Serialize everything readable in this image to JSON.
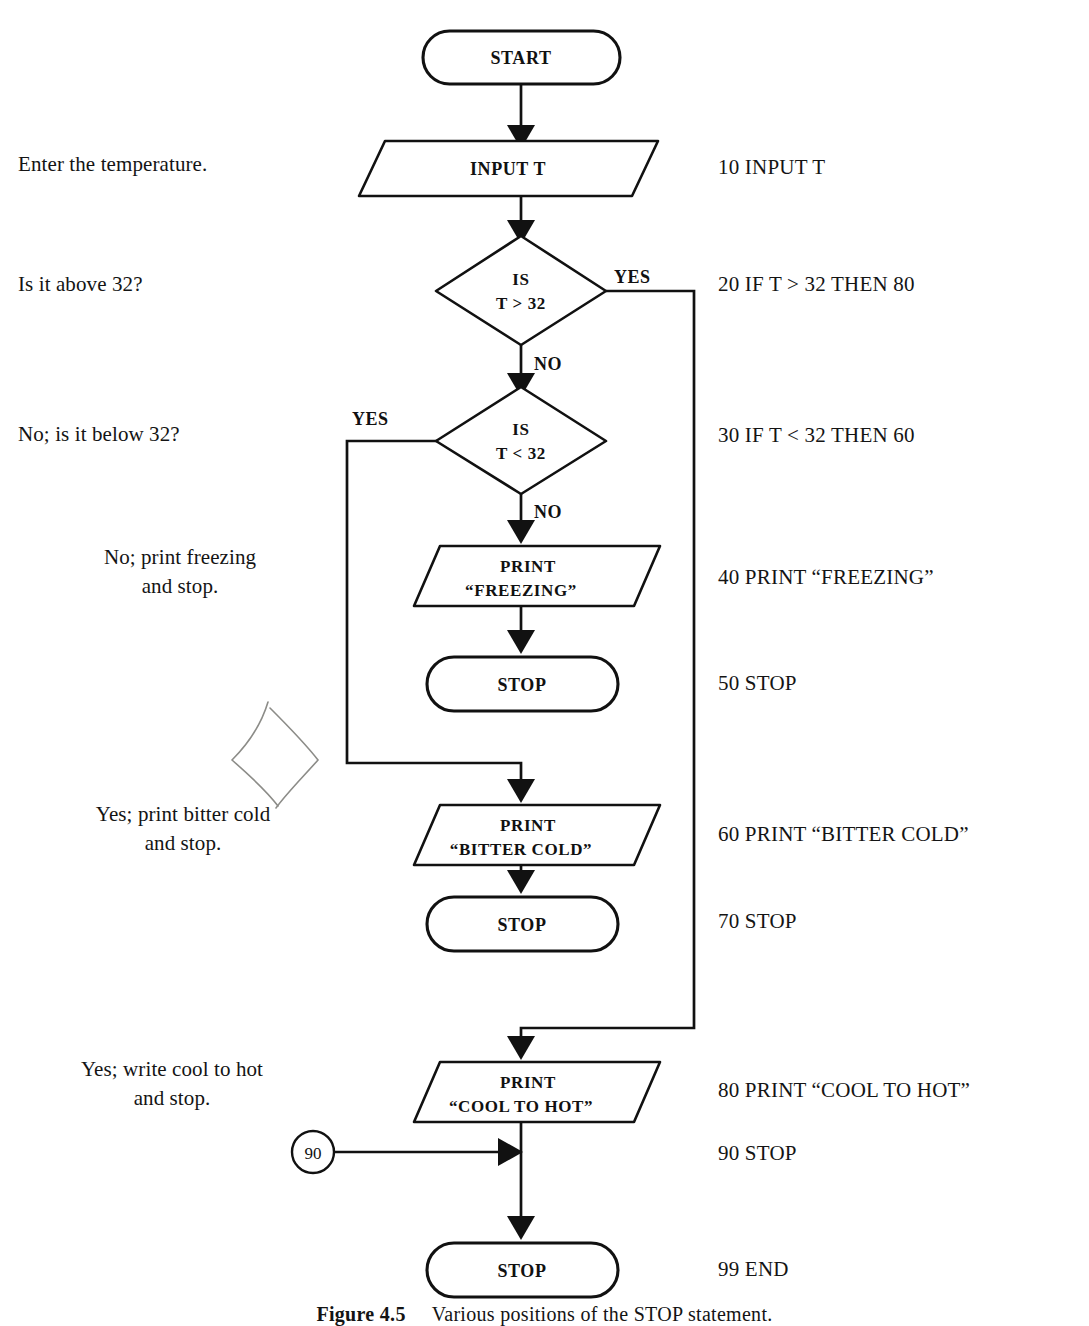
{
  "figure": {
    "caption_label": "Figure 4.5",
    "caption_text": "Various positions of the STOP statement."
  },
  "diagram": {
    "type": "flowchart",
    "nodes": [
      {
        "id": "start",
        "shape": "terminator",
        "lines": [
          "START"
        ]
      },
      {
        "id": "input_t",
        "shape": "parallelogram",
        "lines": [
          "INPUT T"
        ]
      },
      {
        "id": "decision_gt",
        "shape": "diamond",
        "lines": [
          "IS",
          "T > 32"
        ]
      },
      {
        "id": "decision_lt",
        "shape": "diamond",
        "lines": [
          "IS",
          "T < 32"
        ]
      },
      {
        "id": "print_freeze",
        "shape": "parallelogram",
        "lines": [
          "PRINT",
          "“FREEZING”"
        ]
      },
      {
        "id": "stop_50",
        "shape": "terminator",
        "lines": [
          "STOP"
        ]
      },
      {
        "id": "print_bitter",
        "shape": "parallelogram",
        "lines": [
          "PRINT",
          "“BITTER COLD”"
        ]
      },
      {
        "id": "stop_70",
        "shape": "terminator",
        "lines": [
          "STOP"
        ]
      },
      {
        "id": "print_cool",
        "shape": "parallelogram",
        "lines": [
          "PRINT",
          "“COOL TO HOT”"
        ]
      },
      {
        "id": "connector_90",
        "shape": "connector",
        "lines": [
          "90"
        ]
      },
      {
        "id": "stop_99",
        "shape": "terminator",
        "lines": [
          "STOP"
        ]
      }
    ],
    "branch_labels": {
      "gt_yes": "YES",
      "gt_no": "NO",
      "lt_yes": "YES",
      "lt_no": "NO"
    }
  },
  "annotations": [
    {
      "id": "a-enter",
      "text": "Enter the temperature."
    },
    {
      "id": "a-above",
      "text": "Is it above 32?"
    },
    {
      "id": "a-below",
      "text": "No; is it below 32?"
    },
    {
      "id": "a-freeze",
      "text": "No; print freezing\nand stop."
    },
    {
      "id": "a-bitter",
      "text": "Yes; print bitter cold\nand stop."
    },
    {
      "id": "a-cool",
      "text": "Yes; write cool to hot\nand stop."
    }
  ],
  "code_listing": [
    {
      "id": "c10",
      "text": "10 INPUT T"
    },
    {
      "id": "c20",
      "text": "20 IF T > 32 THEN 80"
    },
    {
      "id": "c30",
      "text": "30 IF T < 32 THEN 60"
    },
    {
      "id": "c40",
      "text": "40 PRINT “FREEZING”"
    },
    {
      "id": "c50",
      "text": "50 STOP"
    },
    {
      "id": "c60",
      "text": "60 PRINT “BITTER COLD”"
    },
    {
      "id": "c70",
      "text": "70 STOP"
    },
    {
      "id": "c80",
      "text": "80 PRINT “COOL TO HOT”"
    },
    {
      "id": "c90",
      "text": "90 STOP"
    },
    {
      "id": "c99",
      "text": "99 END"
    }
  ],
  "colors": {
    "ink": "#111111",
    "paper": "#ffffff",
    "sketch": "#8c8c88"
  }
}
